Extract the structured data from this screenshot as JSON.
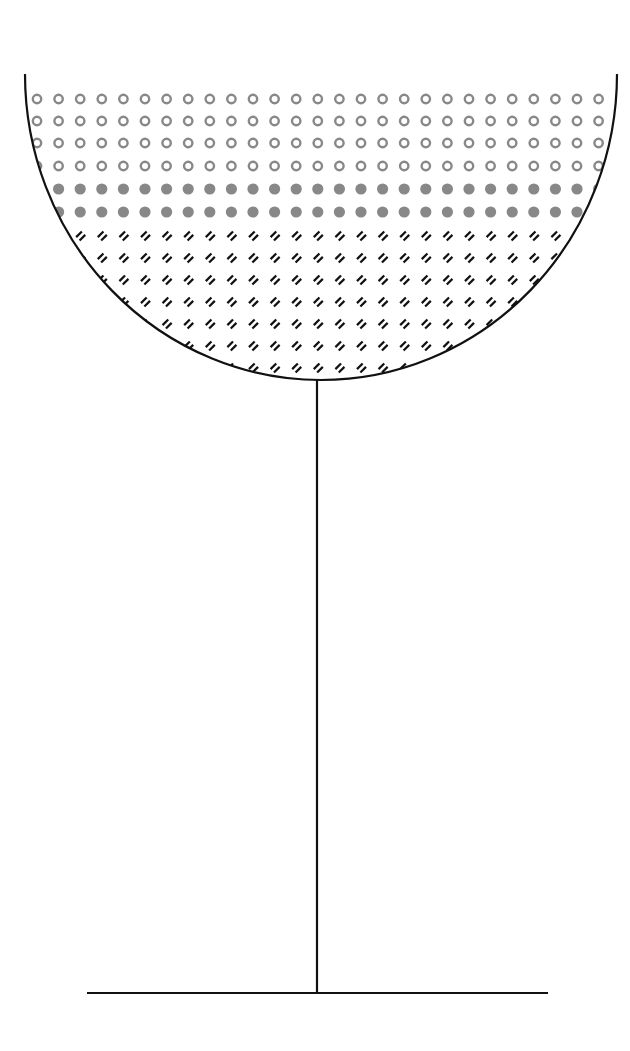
{
  "diagram": {
    "title": "Goblet with layered contents",
    "type": "illustration",
    "colors": {
      "background": "#ffffff",
      "outline": "#111111",
      "ring_dots": "#888888",
      "filled_dots": "#888888",
      "hatch_marks": "#111111"
    },
    "bowl": {
      "shape": "half-ellipse",
      "left_x": 25,
      "right_x": 617,
      "top_y": 74,
      "bottom_y": 380,
      "center_x": 318
    },
    "stem": {
      "x": 317,
      "top_y": 380,
      "bottom_y": 993
    },
    "base": {
      "x1": 87,
      "x2": 548,
      "y": 993
    },
    "grid": {
      "start_x": 37,
      "spacing_x": 21.6,
      "columns": 27
    },
    "layers": [
      {
        "name": "ring-dots-layer",
        "pattern": "open-circles",
        "rows_y": [
          99,
          121,
          143,
          166
        ]
      },
      {
        "name": "filled-dots-layer",
        "pattern": "filled-circles",
        "rows_y": [
          189,
          212
        ]
      },
      {
        "name": "hatch-layer",
        "pattern": "double-dash",
        "rows_y": [
          236,
          258,
          280,
          302,
          324,
          346,
          368
        ]
      }
    ]
  }
}
